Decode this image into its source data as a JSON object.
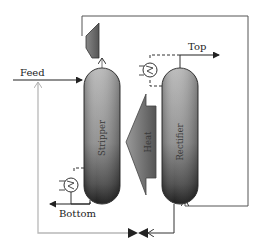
{
  "diagram": {
    "type": "process-flow",
    "title": "",
    "labels": {
      "feed": "Feed",
      "top": "Top",
      "bottom": "Bottom",
      "stripper": "Stripper",
      "rectifier": "Rectifier",
      "heat": "Heat"
    },
    "units": [
      {
        "id": "stripper",
        "kind": "column",
        "label": "Stripper"
      },
      {
        "id": "rectifier",
        "kind": "column",
        "label": "Rectifier"
      },
      {
        "id": "compressor",
        "kind": "compressor"
      },
      {
        "id": "condenser",
        "kind": "heat-exchanger"
      },
      {
        "id": "reboiler",
        "kind": "heat-exchanger"
      },
      {
        "id": "valve",
        "kind": "throttle-valve"
      },
      {
        "id": "heat-transfer",
        "kind": "heat-arrow",
        "label": "Heat",
        "direction": "rectifier-to-stripper"
      }
    ],
    "streams": [
      {
        "from": "feed",
        "to": "stripper",
        "label": "Feed"
      },
      {
        "from": "stripper",
        "to": "compressor"
      },
      {
        "from": "compressor",
        "to": "rectifier-bottom"
      },
      {
        "from": "rectifier",
        "to": "top",
        "label": "Top"
      },
      {
        "from": "stripper",
        "to": "bottom",
        "label": "Bottom"
      },
      {
        "from": "rectifier-bottom",
        "to": "valve"
      },
      {
        "from": "valve",
        "to": "stripper-top",
        "style": "light"
      }
    ],
    "colors": {
      "line": "#333333",
      "return_line": "#b8b8b8",
      "column_top": "#b0b0b0",
      "column_bottom": "#1a1a1a",
      "heat_arrow": "#6a6a6a"
    }
  }
}
